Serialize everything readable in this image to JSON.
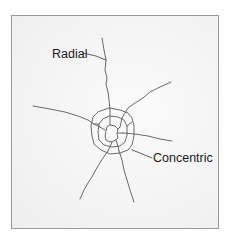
{
  "diagram": {
    "type": "city-street-pattern",
    "labels": {
      "radial": "Radial",
      "concentric": "Concentric"
    },
    "colors": {
      "road_line": "#5a5a5a",
      "frame_border": "#9a9a9a",
      "background": "#f4f4f4",
      "label_text": "#1a1a1a"
    },
    "elements": [
      {
        "id": "radial-roads",
        "description": "Roads radiating outward from center in multiple directions"
      },
      {
        "id": "concentric-rings",
        "description": "Nested ring roads around the center"
      }
    ]
  }
}
